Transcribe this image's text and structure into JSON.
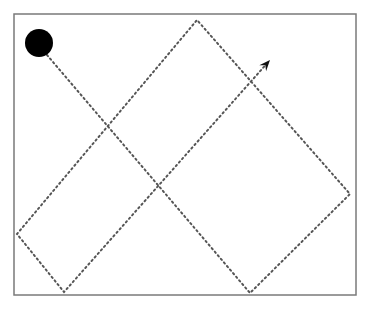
{
  "diagram": {
    "type": "bouncing-path",
    "frame": {
      "x": 14,
      "y": 14,
      "width": 342,
      "height": 281,
      "stroke": "#7a7a7a"
    },
    "start_ball": {
      "cx": 39,
      "cy": 43,
      "r": 14,
      "fill": "#000000"
    },
    "path_points": [
      [
        47,
        55
      ],
      [
        250,
        293
      ],
      [
        350,
        194
      ],
      [
        197,
        20
      ],
      [
        17,
        234
      ],
      [
        64,
        292
      ],
      [
        270,
        60
      ]
    ],
    "path_style": {
      "stroke": "#555555",
      "dash": "1.5 3.2",
      "width": 2
    },
    "arrow_head": {
      "tip": [
        270,
        60
      ],
      "fill": "#111111"
    }
  }
}
